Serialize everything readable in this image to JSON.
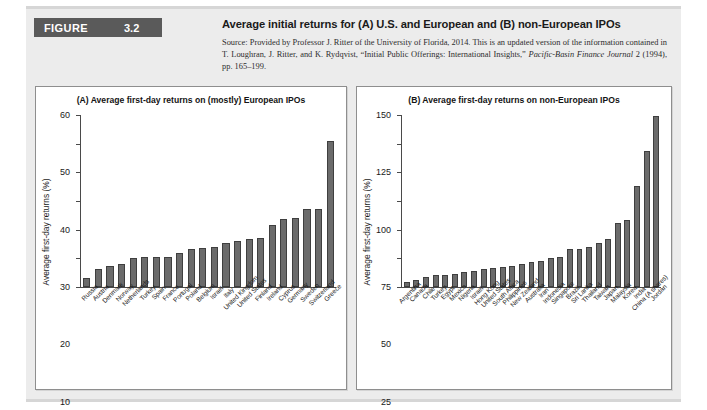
{
  "figure": {
    "badge_word": "FIGURE",
    "number": "3.2",
    "title": "Average initial returns for (A) U.S. and European and (B) non-European IPOs",
    "source_line1": "Source: Provided by Professor J. Ritter of the University of Florida, 2014. This is an updated version of the information",
    "source_line2": "contained in T. Loughran, J. Ritter, and K. Rydqvist, “Initial Public Offerings: International Insights,” ",
    "source_italic": "Pacific-Basin Finance Journal",
    "source_line3": " 2 (1994), pp. 165–199."
  },
  "colors": {
    "bar_fill": "#6b6b6b",
    "bar_stroke": "#3f3f3f",
    "panel_bg": "#ececec",
    "badge_bg": "#5a5a5a",
    "axis": "#4a4a4a"
  },
  "chart_data": [
    {
      "type": "bar",
      "panel": "A",
      "title": "(A) Average first-day returns on (mostly) European IPOs",
      "xlabel": "",
      "ylabel": "Average first-day returns (%)",
      "ylim": [
        0,
        60
      ],
      "yticks": [
        0,
        10,
        20,
        30,
        40,
        50,
        60
      ],
      "grid": false,
      "legend": "none",
      "categories": [
        "Russia",
        "Austria",
        "Denmark",
        "Norway",
        "Netherlands",
        "Turkey",
        "Spain",
        "France",
        "Portugal",
        "Poland",
        "Belgium",
        "Israel",
        "Italy",
        "United Kingdom",
        "United States",
        "Finland",
        "Ireland",
        "Cyprus",
        "Germany",
        "Sweden",
        "Switzerland",
        "Greece"
      ],
      "values": [
        3.3,
        6.4,
        7.4,
        8.1,
        10.2,
        10.3,
        10.3,
        10.5,
        11.9,
        13.3,
        13.5,
        13.8,
        15.2,
        16.0,
        16.9,
        17.2,
        21.6,
        23.7,
        24.2,
        27.2,
        27.3,
        50.8
      ]
    },
    {
      "type": "bar",
      "panel": "B",
      "title": "(B) Average first-day returns on non-European IPOs",
      "xlabel": "",
      "ylabel": "Average first-day returns (%)",
      "ylim": [
        0,
        150
      ],
      "yticks": [
        0,
        25,
        50,
        75,
        100,
        125,
        150
      ],
      "grid": false,
      "legend": "none",
      "categories": [
        "Argentina",
        "Canada",
        "Chile",
        "Turkey",
        "Egypt",
        "Mexico",
        "Nigeria",
        "Israel",
        "Hong Kong",
        "United States",
        "South Africa",
        "Philippines",
        "New Zealand",
        "Australia",
        "Iran",
        "Indonesia",
        "Singapore",
        "Brazil",
        "Sri Lanka",
        "Thailand",
        "Taiwan",
        "Japan",
        "Malaysia",
        "Korea",
        "India",
        "China (A shares)",
        "Jordan"
      ],
      "values": [
        4.4,
        6.5,
        8.4,
        10.8,
        10.4,
        11.6,
        12.7,
        13.8,
        15.8,
        16.9,
        17.4,
        18.1,
        20.3,
        21.8,
        22.4,
        24.9,
        25.8,
        33.1,
        33.5,
        35.1,
        38.1,
        41.7,
        56.2,
        58.8,
        88.0,
        118.4,
        149.0
      ]
    }
  ]
}
